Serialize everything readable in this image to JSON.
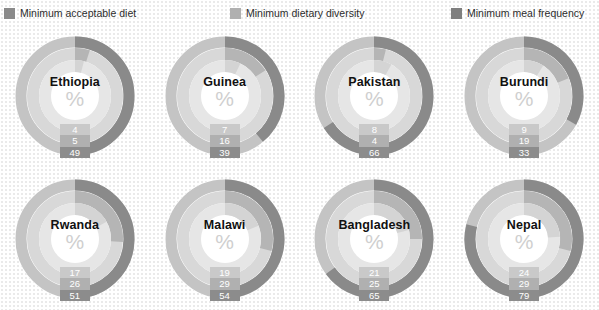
{
  "legend": {
    "items": [
      {
        "label": "Minimum acceptable diet",
        "color": "#8a8a8a",
        "key": "acceptable_diet"
      },
      {
        "label": "Minimum dietary diversity",
        "color": "#b0b0b0",
        "key": "dietary_diversity"
      },
      {
        "label": "Minimum meal frequency",
        "color": "#7f7f7f",
        "key": "meal_frequency"
      }
    ]
  },
  "center_symbol": "%",
  "colors": {
    "ring_outer": "#8a8a8a",
    "ring_middle": "#b5b5b5",
    "ring_inner": "#d4d4d4",
    "track_outer": "#c4c4c4",
    "track_middle": "#d8d8d8",
    "track_inner": "#e6e6e6",
    "label_outer_bg": "#8c8c8c",
    "label_middle_bg": "#b0b0b0",
    "label_inner_bg": "#c9c9c9",
    "label_text": "#ffffff",
    "country_text": "#111111",
    "percent_glyph": "#cfcfcf",
    "background": "#ffffff"
  },
  "chart_data": {
    "type": "pie",
    "title": "",
    "subtype": "concentric-donut-gauges",
    "unit": "%",
    "ring_order": [
      "acceptable_diet",
      "dietary_diversity",
      "meal_frequency"
    ],
    "series": [
      {
        "name": "Minimum acceptable diet",
        "values": [
          4,
          7,
          8,
          9,
          17,
          19,
          21,
          24
        ]
      },
      {
        "name": "Minimum dietary diversity",
        "values": [
          5,
          16,
          4,
          19,
          26,
          29,
          25,
          29
        ]
      },
      {
        "name": "Minimum meal frequency",
        "values": [
          49,
          39,
          66,
          33,
          51,
          54,
          65,
          79
        ]
      }
    ],
    "categories": [
      "Ethiopia",
      "Guinea",
      "Pakistan",
      "Burundi",
      "Rwanda",
      "Malawi",
      "Bangladesh",
      "Nepal"
    ],
    "charts": [
      {
        "country": "Ethiopia",
        "acceptable_diet": 4,
        "dietary_diversity": 5,
        "meal_frequency": 49
      },
      {
        "country": "Guinea",
        "acceptable_diet": 7,
        "dietary_diversity": 16,
        "meal_frequency": 39
      },
      {
        "country": "Pakistan",
        "acceptable_diet": 8,
        "dietary_diversity": 4,
        "meal_frequency": 66
      },
      {
        "country": "Burundi",
        "acceptable_diet": 9,
        "dietary_diversity": 19,
        "meal_frequency": 33
      },
      {
        "country": "Rwanda",
        "acceptable_diet": 17,
        "dietary_diversity": 26,
        "meal_frequency": 51
      },
      {
        "country": "Malawi",
        "acceptable_diet": 19,
        "dietary_diversity": 29,
        "meal_frequency": 54
      },
      {
        "country": "Bangladesh",
        "acceptable_diet": 21,
        "dietary_diversity": 25,
        "meal_frequency": 65
      },
      {
        "country": "Nepal",
        "acceptable_diet": 24,
        "dietary_diversity": 29,
        "meal_frequency": 79
      }
    ],
    "ylim": [
      0,
      100
    ],
    "grid": false,
    "legend_position": "top"
  }
}
